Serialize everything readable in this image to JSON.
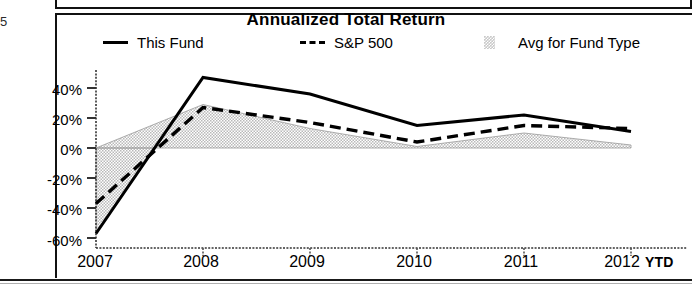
{
  "page": {
    "edge_fragment": "5"
  },
  "chart": {
    "title": "Annualized Total Return",
    "legend": [
      {
        "label": "This Fund",
        "marker": "solid-line-swatch"
      },
      {
        "label": "S&P 500",
        "marker": "dashed-line-swatch"
      },
      {
        "label": "Avg for Fund Type",
        "marker": "shaded-area-swatch"
      }
    ],
    "x_axis_suffix": "YTD"
  },
  "chart_data": {
    "type": "line",
    "title": "Annualized Total Return",
    "xlabel": "",
    "ylabel": "",
    "x": [
      "2007",
      "2008",
      "2009",
      "2010",
      "2011",
      "2012"
    ],
    "xtick_labels": [
      "2007",
      "2008",
      "2009",
      "2010",
      "2011",
      "2012"
    ],
    "ytick_labels": [
      "40%",
      "20%",
      "0%",
      "-20%",
      "-40%",
      "-60%"
    ],
    "yticks": [
      40,
      20,
      0,
      -20,
      -40,
      -60
    ],
    "ylim": [
      -62,
      50
    ],
    "grid": false,
    "legend_position": "top",
    "units": "percent",
    "series": [
      {
        "name": "This Fund",
        "style": "solid",
        "color": "#000000",
        "values": [
          -57,
          47,
          36,
          15,
          22,
          11
        ]
      },
      {
        "name": "S&P 500",
        "style": "dashed",
        "color": "#000000",
        "values": [
          -37,
          27,
          17,
          4,
          15,
          13
        ]
      },
      {
        "name": "Avg for Fund Type",
        "style": "filled-area",
        "color": "#c9c9c9",
        "values": [
          0,
          29,
          13,
          1,
          10,
          2
        ],
        "baseline": 0,
        "note": "shaded band drawn between 0% baseline and the series values"
      }
    ]
  }
}
